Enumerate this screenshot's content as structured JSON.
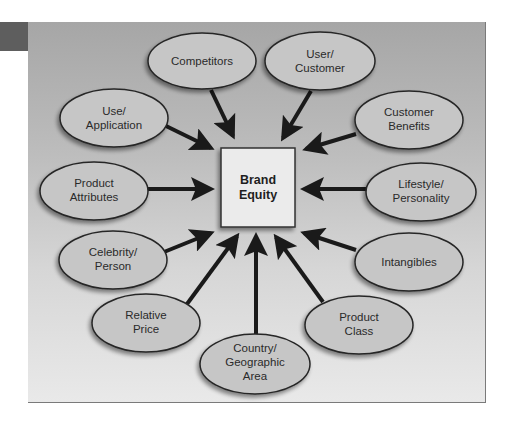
{
  "colors": {
    "panel_top": "#a6a6a6",
    "panel_bottom": "#e9e9e9",
    "tab": "#5e5e5e",
    "ellipse_fill": "#c6c6c6",
    "ellipse_stroke": "#262626",
    "center_fill": "#ebebeb",
    "arrow": "#1a1a1a"
  },
  "center": {
    "label_line1": "Brand",
    "label_line2": "Equity"
  },
  "nodes": [
    {
      "id": "competitors",
      "lines": [
        "Competitors"
      ]
    },
    {
      "id": "user-customer",
      "lines": [
        "User/",
        "Customer"
      ]
    },
    {
      "id": "use-application",
      "lines": [
        "Use/",
        "Application"
      ]
    },
    {
      "id": "customer-benefits",
      "lines": [
        "Customer",
        "Benefits"
      ]
    },
    {
      "id": "product-attributes",
      "lines": [
        "Product",
        "Attributes"
      ]
    },
    {
      "id": "lifestyle-personality",
      "lines": [
        "Lifestyle/",
        "Personality"
      ]
    },
    {
      "id": "celebrity-person",
      "lines": [
        "Celebrity/",
        "Person"
      ]
    },
    {
      "id": "intangibles",
      "lines": [
        "Intangibles"
      ]
    },
    {
      "id": "relative-price",
      "lines": [
        "Relative",
        "Price"
      ]
    },
    {
      "id": "product-class",
      "lines": [
        "Product",
        "Class"
      ]
    },
    {
      "id": "country-geographic-area",
      "lines": [
        "Country/",
        "Geographic",
        "Area"
      ]
    }
  ]
}
